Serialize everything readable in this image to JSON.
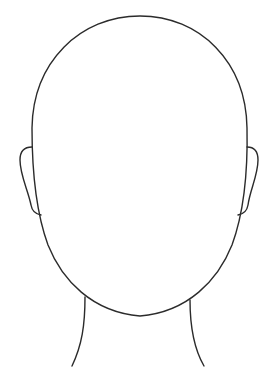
{
  "figure": {
    "title": "Blank face outline template",
    "background_color": "#ffffff",
    "line_color": "#2b2b2b",
    "line_width": 1.4,
    "parts": [
      "head",
      "left-ear",
      "right-ear",
      "neck-left",
      "neck-right"
    ]
  }
}
